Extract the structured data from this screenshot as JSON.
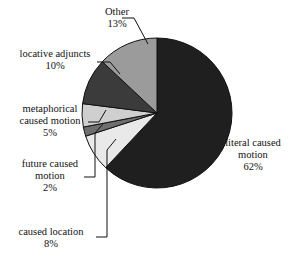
{
  "chart_data": {
    "type": "pie",
    "title": "",
    "subtitle": "",
    "xlabel": "",
    "ylabel": "",
    "legend_position": "none",
    "grid": false,
    "units": "percent",
    "total": 100,
    "start_angle_deg": 0,
    "direction": "clockwise",
    "categories": [
      "literal caused motion",
      "caused location",
      "future caused motion",
      "metaphorical caused motion",
      "locative adjuncts",
      "Other"
    ],
    "values": [
      62,
      8,
      2,
      5,
      10,
      13
    ],
    "slices": [
      {
        "name": "literal caused motion",
        "value": 62,
        "value_label": "62%",
        "label_lines": [
          "literal caused",
          "motion",
          "62%"
        ],
        "color": "#1f1f1f"
      },
      {
        "name": "caused location",
        "value": 8,
        "value_label": "8%",
        "label_lines": [
          "caused location",
          "8%"
        ],
        "color": "#e9e9e9"
      },
      {
        "name": "future caused motion",
        "value": 2,
        "value_label": "2%",
        "label_lines": [
          "future caused",
          "motion",
          "2%"
        ],
        "color": "#6e6e6e"
      },
      {
        "name": "metaphorical caused motion",
        "value": 5,
        "value_label": "5%",
        "label_lines": [
          "metaphorical",
          "caused motion",
          "5%"
        ],
        "color": "#cfcfcf"
      },
      {
        "name": "locative adjuncts",
        "value": 10,
        "value_label": "10%",
        "label_lines": [
          "locative adjuncts",
          "10%"
        ],
        "color": "#3b3b3b"
      },
      {
        "name": "Other",
        "value": 13,
        "value_label": "13%",
        "label_lines": [
          "Other",
          "13%"
        ],
        "color": "#9b9b9b"
      }
    ]
  },
  "labels": {
    "other": {
      "line1": "Other",
      "line2": "13%"
    },
    "locative_adjuncts": {
      "line1": "locative adjuncts",
      "line2": "10%"
    },
    "metaphorical_caused_motion": {
      "line1": "metaphorical",
      "line2": "caused motion",
      "line3": "5%"
    },
    "future_caused_motion": {
      "line1": "future caused",
      "line2": "motion",
      "line3": "2%"
    },
    "caused_location": {
      "line1": "caused location",
      "line2": "8%"
    },
    "literal_caused_motion": {
      "line1": "literal caused",
      "line2": "motion",
      "line3": "62%"
    }
  },
  "style": {
    "background": "#ffffff",
    "outline": "#111111",
    "leader_line": "#111111"
  }
}
